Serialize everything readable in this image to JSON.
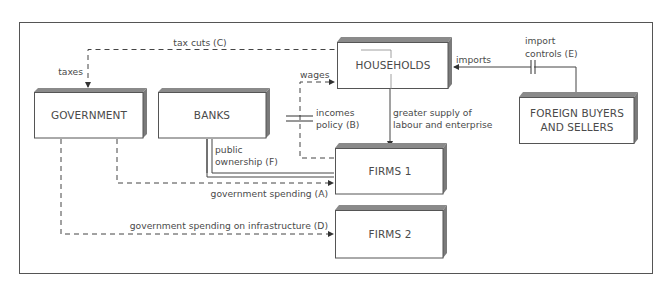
{
  "diagram": {
    "type": "flow-diagram",
    "colors": {
      "frame": "#555555",
      "box_face": "#ffffff",
      "box_top": "#8a8a8a",
      "box_side": "#7a7a7a",
      "line": "#444444",
      "text": "#4a4a4a"
    },
    "nodes": {
      "government": "GOVERNMENT",
      "banks": "BANKS",
      "households": "HOUSEHOLDS",
      "foreign_line1": "FOREIGN BUYERS",
      "foreign_line2": "AND SELLERS",
      "firms1": "FIRMS 1",
      "firms2": "FIRMS 2"
    },
    "labels": {
      "tax_cuts": "tax cuts (C)",
      "taxes": "taxes",
      "wages": "wages",
      "incomes_line1": "incomes",
      "incomes_line2": "policy (B)",
      "imports": "imports",
      "import_controls_line1": "import",
      "import_controls_line2": "controls (E)",
      "supply_line1": "greater supply of",
      "supply_line2": "labour and enterprise",
      "public_line1": "public",
      "public_line2": "ownership (F)",
      "gov_spending": "government spending (A)",
      "gov_infra": "government spending on infrastructure (D)"
    },
    "edges": [
      {
        "from": "households",
        "to": "government",
        "label": "tax cuts (C) / taxes",
        "style": "dashed"
      },
      {
        "from": "firms1",
        "to": "households",
        "label": "wages",
        "style": "dashed",
        "blocked_by": "incomes policy (B)"
      },
      {
        "from": "foreign",
        "to": "households",
        "label": "imports",
        "style": "solid",
        "blocked_by": "import controls (E)"
      },
      {
        "from": "households",
        "to": "firms1",
        "label": "greater supply of labour and enterprise",
        "style": "solid"
      },
      {
        "from": "banks",
        "to": "firms1",
        "label": "public ownership (F)",
        "style": "solid"
      },
      {
        "from": "government",
        "to": "firms1",
        "label": "government spending (A)",
        "style": "dashed"
      },
      {
        "from": "government",
        "to": "firms2",
        "label": "government spending on infrastructure (D)",
        "style": "dashed"
      }
    ]
  }
}
